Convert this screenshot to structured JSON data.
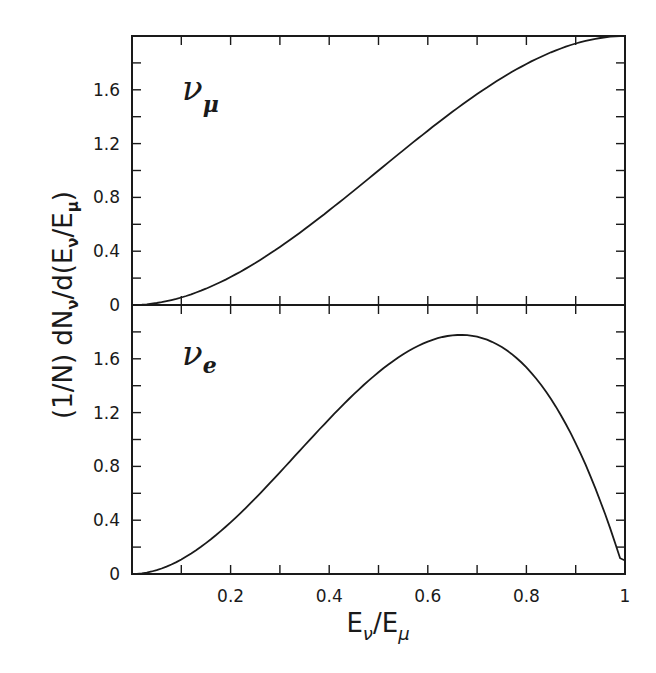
{
  "chart_data": [
    {
      "type": "line",
      "panel": "top",
      "annotation": "ν_μ",
      "annotation_main": "ν",
      "annotation_sub": "μ",
      "xlim": [
        0,
        1
      ],
      "ylim": [
        0,
        2.0
      ],
      "ylabel": "(1/N) dN_ν/d(E_ν/E_μ)",
      "yticks": [
        0,
        0.4,
        0.8,
        1.2,
        1.6
      ],
      "yticks_minor_step": 0.2,
      "x": [
        0,
        0.1,
        0.2,
        0.3,
        0.4,
        0.5,
        0.6,
        0.7,
        0.8,
        0.9,
        1.0
      ],
      "series": [
        {
          "name": "nu_mu",
          "values": [
            0,
            0.056,
            0.208,
            0.432,
            0.704,
            1.0,
            1.296,
            1.568,
            1.792,
            1.944,
            2.0
          ]
        }
      ],
      "grid": false
    },
    {
      "type": "line",
      "panel": "bottom",
      "annotation": "ν_e",
      "annotation_main": "ν",
      "annotation_sub": "e",
      "xlim": [
        0,
        1
      ],
      "ylim": [
        0,
        2.0
      ],
      "xlabel": "E_ν/E_μ",
      "yticks": [
        0,
        0.4,
        0.8,
        1.2,
        1.6
      ],
      "xticks": [
        0.2,
        0.4,
        0.6,
        0.8,
        1
      ],
      "x": [
        0,
        0.1,
        0.2,
        0.3,
        0.4,
        0.5,
        0.6,
        0.667,
        0.7,
        0.8,
        0.9,
        1.0
      ],
      "series": [
        {
          "name": "nu_e",
          "values": [
            0,
            0.108,
            0.384,
            0.756,
            1.152,
            1.5,
            1.728,
            1.778,
            1.764,
            1.536,
            0.972,
            0.1
          ]
        }
      ],
      "grid": false
    }
  ],
  "axes": {
    "ylabel_parts": {
      "pre": "(1/N)  dN",
      "sub1": "ν",
      "mid": "/d(E",
      "sub2": "ν",
      "mid2": "/E",
      "sub3": "μ",
      "post": ")"
    },
    "xlabel_parts": {
      "main1": "E",
      "sub1": "ν",
      "slash": "/",
      "main2": "E",
      "sub2": "μ"
    },
    "ytick_labels": [
      "0",
      "0.4",
      "0.8",
      "1.2",
      "1.6"
    ],
    "xtick_labels": [
      "0.2",
      "0.4",
      "0.6",
      "0.8",
      "1"
    ]
  }
}
